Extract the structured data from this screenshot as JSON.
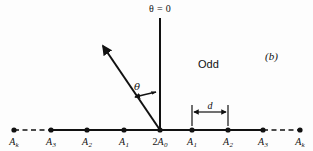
{
  "figure": {
    "panel_label": "(b)",
    "region_label": "Odd",
    "axis_label": "θ = 0",
    "angle_label": "θ",
    "spacing_label": "d",
    "background_color": "#fdfdfd",
    "stroke_color": "#111111"
  },
  "baseline": {
    "y": 130,
    "center_x": 160,
    "nodes": [
      {
        "id": "left-k",
        "x": 14,
        "letter": "A",
        "sub": "k",
        "coef": "",
        "label_x": 14,
        "dashed_to_neighbor": true
      },
      {
        "id": "left-3",
        "x": 51,
        "letter": "A",
        "sub": "3",
        "coef": "",
        "label_x": 51,
        "dashed_to_neighbor": false
      },
      {
        "id": "left-2",
        "x": 87,
        "letter": "A",
        "sub": "2",
        "coef": "",
        "label_x": 87,
        "dashed_to_neighbor": false
      },
      {
        "id": "left-1",
        "x": 124,
        "letter": "A",
        "sub": "1",
        "coef": "",
        "label_x": 124,
        "dashed_to_neighbor": false
      },
      {
        "id": "center-0",
        "x": 160,
        "letter": "A",
        "sub": "0",
        "coef": "2",
        "label_x": 160,
        "dashed_to_neighbor": false
      },
      {
        "id": "right-1",
        "x": 192,
        "letter": "A",
        "sub": "1",
        "coef": "",
        "label_x": 192,
        "dashed_to_neighbor": false
      },
      {
        "id": "right-2",
        "x": 228,
        "letter": "A",
        "sub": "2",
        "coef": "",
        "label_x": 228,
        "dashed_to_neighbor": false
      },
      {
        "id": "right-3",
        "x": 263,
        "letter": "A",
        "sub": "3",
        "coef": "",
        "label_x": 263,
        "dashed_to_neighbor": false
      },
      {
        "id": "right-k",
        "x": 300,
        "letter": "A",
        "sub": "k",
        "coef": "",
        "label_x": 300,
        "dashed_to_neighbor": true
      }
    ]
  },
  "dimension": {
    "from_x": 192,
    "to_x": 228,
    "y": 112,
    "label_x": 210,
    "label_y": 104
  },
  "rays": {
    "vertical": {
      "x": 160,
      "y_top": 18,
      "y_bottom": 130
    },
    "diagonal": {
      "tip_x": 101,
      "tip_y": 44,
      "base_x": 160,
      "base_y": 130
    }
  },
  "positions": {
    "axis_label_x": 160,
    "axis_label_y": 4,
    "angle_label_x": 134,
    "angle_label_y": 83,
    "odd_label_x": 198,
    "odd_label_y": 60,
    "panel_label_x": 265,
    "panel_label_y": 52,
    "node_label_y": 137
  }
}
